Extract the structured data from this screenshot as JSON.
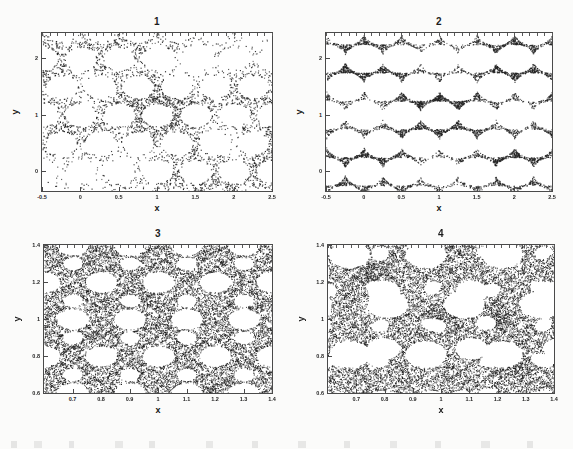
{
  "figure": {
    "caption_fragment": "",
    "background_color": "#fbfbfa",
    "ink_color": "#1d1d1d",
    "frame_color": "#4a4a4a"
  },
  "chart_data": [
    {
      "type": "scatter",
      "title": "1",
      "xlabel": "x",
      "ylabel": "y",
      "xlim": [
        -0.5,
        2.5
      ],
      "ylim": [
        -0.35,
        2.45
      ],
      "grid": false,
      "legend": null,
      "xticks": [
        -0.5,
        0,
        0.5,
        1,
        1.5,
        2,
        2.5
      ],
      "xticklabels": [
        "-0.5",
        "0",
        "0.5",
        "1",
        "1.5",
        "2",
        "2.5"
      ],
      "yticks": [
        0,
        1,
        2
      ],
      "yticklabels": [
        "0",
        "1",
        "2"
      ],
      "marker": "dot",
      "marker_color": "#222222",
      "point_count": 3200,
      "description": "Sparse self-similar fractal attractor band running from upper-left to lower-right with circular voids",
      "generator": {
        "kind": "ifs-sierpinski-lattice",
        "seed": 11,
        "density": 0.34,
        "lattice_scale": 1.0,
        "band_angle_deg": -27,
        "band_halfwidth": 0.82,
        "hole_radius": 0.2,
        "depth": 5
      }
    },
    {
      "type": "scatter",
      "title": "2",
      "xlabel": "x",
      "ylabel": "y",
      "xlim": [
        -0.5,
        2.5
      ],
      "ylim": [
        -0.35,
        2.45
      ],
      "grid": false,
      "legend": null,
      "xticks": [
        -0.5,
        0,
        0.5,
        1,
        1.5,
        2,
        2.5
      ],
      "xticklabels": [
        "-0.5",
        "0",
        "0.5",
        "1",
        "1.5",
        "2",
        "2.5"
      ],
      "yticks": [
        0,
        1,
        2
      ],
      "yticklabels": [
        "0",
        "1",
        "2"
      ],
      "marker": "dot",
      "marker_color": "#222222",
      "point_count": 5200,
      "description": "Denser clustered fractal set with large empty lacunae, clumps near x=0.1, x=1.0 and x=2.0",
      "generator": {
        "kind": "ifs-sierpinski-lattice",
        "seed": 27,
        "density": 0.56,
        "lattice_scale": 1.0,
        "band_angle_deg": 0,
        "band_halfwidth": 1.35,
        "hole_radius": 0.26,
        "depth": 5
      }
    },
    {
      "type": "scatter",
      "title": "3",
      "xlabel": "x",
      "ylabel": "y",
      "xlim": [
        0.6,
        1.4
      ],
      "ylim": [
        0.6,
        1.4
      ],
      "grid": false,
      "legend": null,
      "xticks": [
        0.7,
        0.8,
        0.9,
        1,
        1.1,
        1.2,
        1.3,
        1.4
      ],
      "xticklabels": [
        "0.7",
        "0.8",
        "0.9",
        "1",
        "1.1",
        "1.2",
        "1.3",
        "1.4"
      ],
      "yticks": [
        0.6,
        0.8,
        1,
        1.2,
        1.4
      ],
      "yticklabels": [
        "0.6",
        "0.8",
        "1",
        "1.2",
        "1.4"
      ],
      "marker": "dot",
      "marker_color": "#1a1a1a",
      "point_count": 14000,
      "description": "Magnified view: dense speckled field riddled with near-circular white holes arranged on a lattice, plus diagonal striations",
      "generator": {
        "kind": "dense-hole-lattice",
        "seed": 5,
        "density": 0.9,
        "hole_spacing": 0.2,
        "hole_radius": 0.055,
        "stripe_angle_deg": -55,
        "stripe_strength": 0.35
      }
    },
    {
      "type": "scatter",
      "title": "4",
      "xlabel": "x",
      "ylabel": "y",
      "xlim": [
        0.6,
        1.4
      ],
      "ylim": [
        0.6,
        1.4
      ],
      "grid": false,
      "legend": null,
      "xticks": [
        0.7,
        0.8,
        0.9,
        1,
        1.1,
        1.2,
        1.3,
        1.4
      ],
      "xticklabels": [
        "0.7",
        "0.8",
        "0.9",
        "1",
        "1.1",
        "1.2",
        "1.3",
        "1.4"
      ],
      "yticks": [
        0.6,
        0.8,
        1,
        1.2,
        1.4
      ],
      "yticklabels": [
        "0.6",
        "0.8",
        "1",
        "1.2",
        "1.4"
      ],
      "marker": "dot",
      "marker_color": "#1a1a1a",
      "point_count": 13000,
      "description": "Magnified view with coarser blobby voids and dark dense knots near (1.0,1.0), (0.75,1.25) and (1.25,0.75)",
      "generator": {
        "kind": "blob-void-field",
        "seed": 91,
        "density": 0.82,
        "hole_spacing": 0.27,
        "hole_radius": 0.072,
        "knots": [
          [
            1.0,
            1.02
          ],
          [
            0.76,
            1.25
          ],
          [
            1.25,
            0.75
          ],
          [
            1.2,
            1.0
          ]
        ]
      }
    }
  ],
  "panels": [
    {
      "id": "panel-1",
      "left": 8,
      "top": 6,
      "width": 282,
      "height": 212,
      "plot": {
        "left": 33,
        "top": 26,
        "width": 232,
        "height": 160
      }
    },
    {
      "id": "panel-2",
      "left": 293,
      "top": 6,
      "width": 280,
      "height": 212,
      "plot": {
        "left": 32,
        "top": 26,
        "width": 228,
        "height": 160
      }
    },
    {
      "id": "panel-3",
      "left": 8,
      "top": 222,
      "width": 282,
      "height": 206,
      "plot": {
        "left": 35,
        "top": 22,
        "width": 230,
        "height": 150
      }
    },
    {
      "id": "panel-4",
      "left": 293,
      "top": 222,
      "width": 280,
      "height": 206,
      "plot": {
        "left": 34,
        "top": 22,
        "width": 228,
        "height": 150
      }
    }
  ]
}
